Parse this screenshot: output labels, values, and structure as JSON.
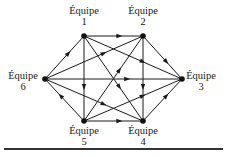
{
  "diagram": {
    "type": "directed-graph",
    "nodes": [
      {
        "id": 1,
        "label_word": "Équipe",
        "label_num": "1",
        "x": 84,
        "y": 36,
        "lx": 64,
        "ly": 5
      },
      {
        "id": 2,
        "label_word": "Équipe",
        "label_num": "2",
        "x": 143,
        "y": 36,
        "lx": 123,
        "ly": 5
      },
      {
        "id": 3,
        "label_word": "Équipe",
        "label_num": "3",
        "x": 182,
        "y": 79,
        "lx": 181,
        "ly": 70
      },
      {
        "id": 4,
        "label_word": "Équipe",
        "label_num": "4",
        "x": 143,
        "y": 121,
        "lx": 123,
        "ly": 125
      },
      {
        "id": 5,
        "label_word": "Équipe",
        "label_num": "5",
        "x": 84,
        "y": 121,
        "lx": 64,
        "ly": 125
      },
      {
        "id": 6,
        "label_word": "Équipe",
        "label_num": "6",
        "x": 45,
        "y": 79,
        "lx": 3,
        "ly": 70
      }
    ],
    "edges": [
      {
        "from": 1,
        "to": 2
      },
      {
        "from": 6,
        "to": 1
      },
      {
        "from": 2,
        "to": 3
      },
      {
        "from": 4,
        "to": 3
      },
      {
        "from": 5,
        "to": 4
      },
      {
        "from": 5,
        "to": 6
      },
      {
        "from": 1,
        "to": 5
      },
      {
        "from": 2,
        "to": 4
      },
      {
        "from": 6,
        "to": 3
      },
      {
        "from": 1,
        "to": 3
      },
      {
        "from": 1,
        "to": 4
      },
      {
        "from": 6,
        "to": 2
      },
      {
        "from": 6,
        "to": 4
      },
      {
        "from": 5,
        "to": 2
      },
      {
        "from": 5,
        "to": 3
      }
    ],
    "colors": {
      "stroke": "#1a1a1a",
      "node": "#111111"
    }
  },
  "labels": {
    "n1_word": "Équipe",
    "n1_num": "1",
    "n2_word": "Équipe",
    "n2_num": "2",
    "n3_word": "Équipe",
    "n3_num": "3",
    "n4_word": "Équipe",
    "n4_num": "4",
    "n5_word": "Équipe",
    "n5_num": "5",
    "n6_word": "Équipe",
    "n6_num": "6"
  }
}
